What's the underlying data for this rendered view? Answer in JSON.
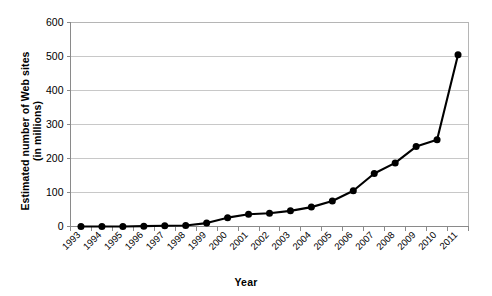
{
  "chart_data": {
    "type": "line",
    "title": "",
    "xlabel": "Year",
    "ylabel": "Estimated number of Web sites (in millions)",
    "ylabel_line1": "Estimated number of Web sites",
    "ylabel_line2": "(in millions)",
    "categories": [
      "1993",
      "1994",
      "1995",
      "1996",
      "1997",
      "1998",
      "1999",
      "2000",
      "2001",
      "2002",
      "2003",
      "2004",
      "2005",
      "2006",
      "2007",
      "2008",
      "2009",
      "2010",
      "2011"
    ],
    "values": [
      0,
      0,
      0,
      1,
      2,
      3,
      10,
      26,
      36,
      39,
      46,
      57,
      75,
      105,
      156,
      187,
      235,
      255,
      505
    ],
    "x": [
      1993,
      1994,
      1995,
      1996,
      1997,
      1998,
      1999,
      2000,
      2001,
      2002,
      2003,
      2004,
      2005,
      2006,
      2007,
      2008,
      2009,
      2010,
      2011
    ],
    "ylim": [
      0,
      600
    ],
    "yticks": [
      0,
      100,
      200,
      300,
      400,
      500,
      600
    ],
    "ytick_labels": [
      "0",
      "100",
      "200",
      "300",
      "400",
      "500",
      "600"
    ],
    "grid": true,
    "grid_axis": "y",
    "legend": false,
    "legend_position": "none",
    "series_color": "#000000",
    "gridline_color": "#c8c8c8",
    "marker": "circle",
    "xtick_label_rotation": -45
  }
}
